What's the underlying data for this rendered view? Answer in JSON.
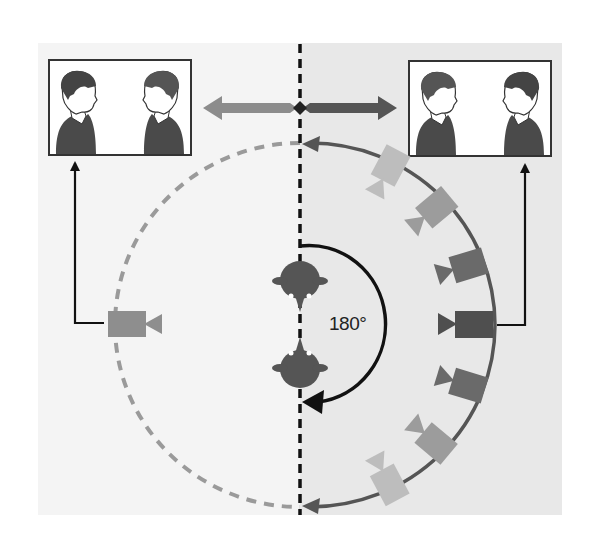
{
  "diagram": {
    "angle_label": "180°",
    "colors": {
      "panel_left": "#f4f4f4",
      "panel_right": "#e8e8e8",
      "axis_line": "#111111",
      "allowed_arc": "#555555",
      "forbidden_arc": "#9a9a9a",
      "person_fill": "#555555",
      "frame_border": "#333333",
      "arrow_left": "#8c8c8c",
      "arrow_right": "#555555"
    },
    "frames": [
      {
        "id": "left-frame",
        "description": "Shot from camera on left side: two people facing each other, positions swapped"
      },
      {
        "id": "right-frame",
        "description": "Shot from camera on right side: two people facing each other"
      }
    ],
    "cameras": {
      "left_side": {
        "count": 1,
        "tone": "light"
      },
      "right_side": {
        "count": 7,
        "tones": [
          "very-light",
          "light",
          "medium",
          "dark",
          "medium",
          "light",
          "very-light"
        ]
      }
    },
    "subjects": [
      {
        "id": "person-top",
        "facing": "down"
      },
      {
        "id": "person-bottom",
        "facing": "up"
      }
    ]
  }
}
